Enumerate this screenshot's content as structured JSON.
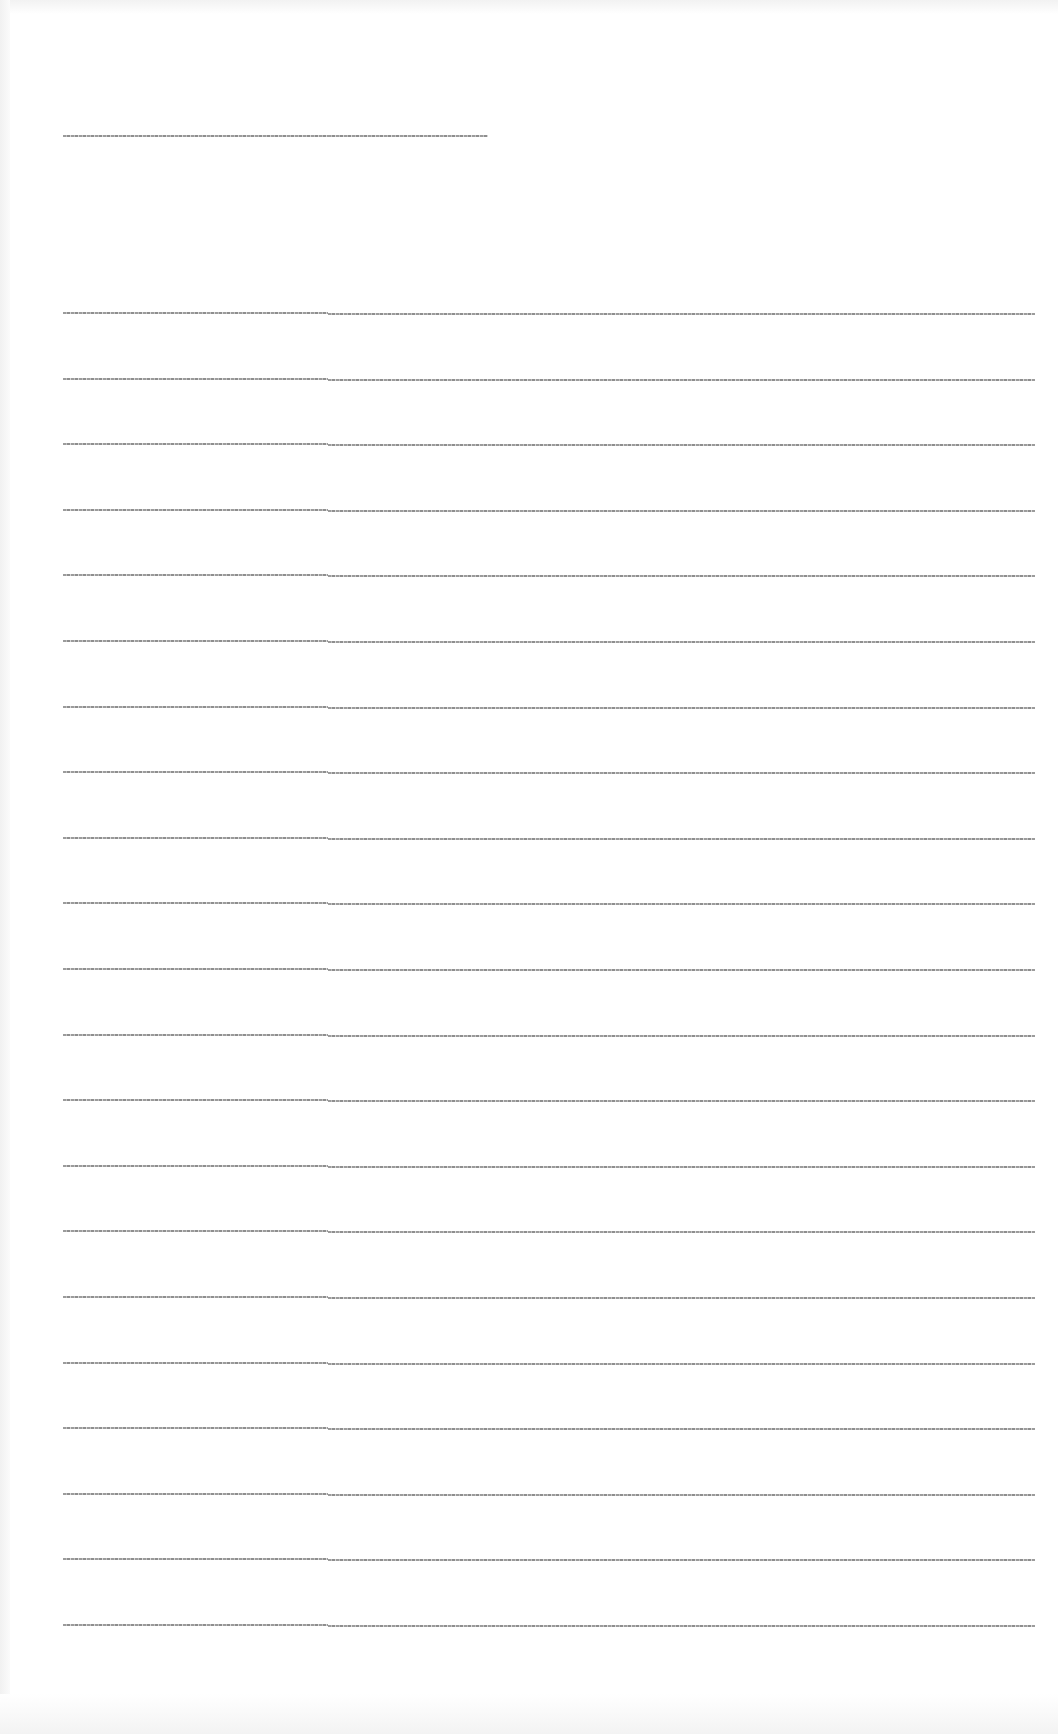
{
  "document": {
    "heading": {
      "part_a": "[illegible text]",
      "part_b": "[illegible text]"
    },
    "rows": [
      {
        "label": "[illegible]",
        "value": "[illegible]"
      },
      {
        "label": "[illegible]",
        "value": "[illegible]"
      },
      {
        "label": "[illegible]",
        "value": "[illegible]"
      },
      {
        "label": "[illegible]",
        "value": "[illegible]"
      },
      {
        "label": "[illegible]",
        "value": "[illegible]"
      },
      {
        "label": "[illegible]",
        "value": "[illegible]"
      },
      {
        "label": "[illegible]",
        "value": "[illegible]"
      },
      {
        "label": "[illegible]",
        "value": "[illegible]"
      },
      {
        "label": "[illegible]",
        "value": "[illegible]"
      },
      {
        "label": "[illegible]",
        "value": "[illegible]"
      },
      {
        "label": "[illegible]",
        "value": "[illegible]"
      },
      {
        "label": "[illegible]",
        "value": "[illegible]"
      },
      {
        "label": "[illegible]",
        "value": "[illegible]"
      },
      {
        "label": "[illegible]",
        "value": "[illegible]"
      },
      {
        "label": "[illegible]",
        "value": "[illegible]"
      },
      {
        "label": "[illegible]",
        "value": "[illegible]"
      },
      {
        "label": "[illegible]",
        "value": "[illegible]"
      },
      {
        "label": "[illegible]",
        "value": "[illegible]"
      },
      {
        "label": "[illegible]",
        "value": "[illegible]"
      },
      {
        "label": "[illegible]",
        "value": "[illegible]"
      },
      {
        "label": "[illegible]",
        "value": "[illegible]"
      }
    ]
  },
  "colors": {
    "background": "#ffffff",
    "text": "#8a8a8a"
  }
}
